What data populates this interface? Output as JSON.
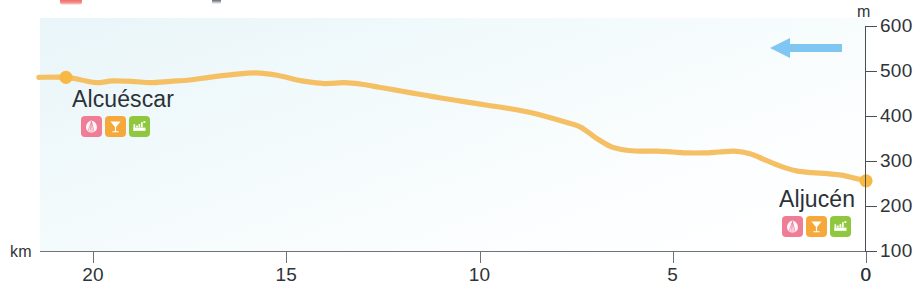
{
  "chart_data": {
    "type": "line",
    "title": "",
    "subtitle": "",
    "xlabel": "km",
    "ylabel": "m",
    "xlim": [
      21.4,
      0
    ],
    "ylim": [
      100,
      600
    ],
    "x_ticks": [
      20,
      15,
      10,
      5,
      0
    ],
    "y_ticks": [
      600,
      500,
      400,
      300,
      200,
      100
    ],
    "y_axis_origin_label": "0",
    "x_axis_reversed": true,
    "grid": false,
    "legend": "none",
    "line_color": "#f5bf63",
    "marker_color": "#f7b844",
    "series": [
      {
        "name": "Elevation profile",
        "x": [
          21.4,
          20.7,
          20.3,
          19.9,
          19.5,
          19.0,
          18.5,
          18.0,
          17.5,
          17.0,
          16.4,
          15.8,
          15.2,
          14.6,
          14.0,
          13.5,
          13.0,
          12.6,
          12.2,
          11.8,
          11.4,
          11.0,
          10.4,
          9.8,
          9.2,
          8.6,
          8.0,
          7.4,
          7.0,
          6.6,
          6.2,
          5.8,
          5.4,
          5.0,
          4.6,
          4.2,
          3.8,
          3.4,
          3.0,
          2.6,
          2.2,
          1.8,
          1.4,
          1.0,
          0.6,
          0.3,
          0.0
        ],
        "y": [
          486,
          486,
          480,
          474,
          478,
          477,
          474,
          477,
          480,
          486,
          492,
          496,
          490,
          478,
          472,
          474,
          470,
          464,
          458,
          452,
          446,
          440,
          432,
          424,
          416,
          406,
          392,
          376,
          352,
          332,
          324,
          322,
          322,
          320,
          318,
          318,
          320,
          322,
          316,
          302,
          288,
          278,
          274,
          272,
          268,
          262,
          256
        ]
      }
    ],
    "markers": [
      {
        "label": "Alcuéscar",
        "km": 20.7,
        "elevation_m": 486
      },
      {
        "label": "Aljucén",
        "km": 0.0,
        "elevation_m": 256
      }
    ],
    "annotations": [
      {
        "name": "direction-arrow",
        "direction": "left",
        "color": "#7fc6f0"
      }
    ]
  },
  "axes": {
    "y_unit": "m",
    "x_unit": "km",
    "y_ticks": [
      "600",
      "500",
      "400",
      "300",
      "200",
      "100"
    ],
    "y_origin": "0",
    "x_ticks": [
      "20",
      "15",
      "10",
      "5",
      "0"
    ]
  },
  "places": {
    "left": {
      "name": "Alcuéscar",
      "pois": [
        {
          "name": "shell-icon",
          "color": "#ef7d96"
        },
        {
          "name": "restaurant-icon",
          "color": "#f6a93b"
        },
        {
          "name": "lodging-icon",
          "color": "#8fc83f"
        }
      ]
    },
    "right": {
      "name": "Aljucén",
      "pois": [
        {
          "name": "shell-icon",
          "color": "#ef7d96"
        },
        {
          "name": "restaurant-icon",
          "color": "#f6a93b"
        },
        {
          "name": "lodging-icon",
          "color": "#8fc83f"
        }
      ]
    }
  },
  "colors": {
    "profile_line": "#f5bf63",
    "plot_background": "#eef7fa",
    "arrow": "#7fc6f0",
    "axis": "#4a4f55",
    "text": "#2b3137"
  }
}
